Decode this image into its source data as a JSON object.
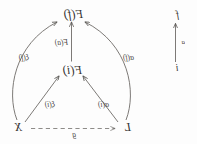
{
  "figure": {
    "type": "commutative-diagram",
    "orientation": "horizontally-mirrored",
    "background_color": "#fdfdfd",
    "ink_color": "#4a4744"
  },
  "mini_diagram": {
    "source_label": "i",
    "target_label": "f",
    "arrow_label": "a",
    "arrow_style": "solid"
  },
  "main_diagram": {
    "nodes": {
      "top": "F(f)",
      "middle": "F(i)",
      "bottom_left": "L",
      "bottom_right": "X"
    },
    "edges": [
      {
        "from": "L",
        "to": "F(f)",
        "label": "α(f)",
        "style": "curved-solid"
      },
      {
        "from": "X",
        "to": "F(f)",
        "label": "ξ(f)",
        "style": "curved-solid"
      },
      {
        "from": "L",
        "to": "F(i)",
        "label": "α(i)",
        "style": "straight-solid"
      },
      {
        "from": "X",
        "to": "F(i)",
        "label": "ξ(i)",
        "style": "straight-solid"
      },
      {
        "from": "F(i)",
        "to": "F(f)",
        "label": "F(a)",
        "style": "straight-solid"
      },
      {
        "from": "X",
        "to": "L",
        "label": "g",
        "style": "dashed"
      }
    ]
  }
}
